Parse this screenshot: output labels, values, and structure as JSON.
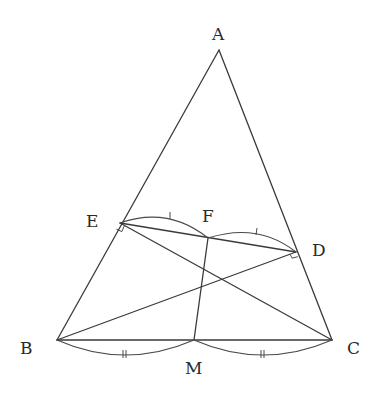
{
  "diagram": {
    "title": "",
    "points": {
      "A": {
        "label": "A",
        "x": 219,
        "y": 50
      },
      "B": {
        "label": "B",
        "x": 57,
        "y": 340
      },
      "C": {
        "label": "C",
        "x": 332,
        "y": 340
      },
      "D": {
        "label": "D",
        "x": 296,
        "y": 252
      },
      "E": {
        "label": "E",
        "x": 120,
        "y": 223
      },
      "F": {
        "label": "F",
        "x": 208,
        "y": 238
      },
      "M": {
        "label": "M",
        "x": 194,
        "y": 340
      }
    },
    "labels": {
      "A": "A",
      "B": "B",
      "C": "C",
      "D": "D",
      "E": "E",
      "F": "F",
      "M": "M"
    },
    "segments": [
      "AB",
      "AC",
      "BC",
      "BD",
      "CE",
      "ED",
      "FM"
    ],
    "right_angles": [
      "E (CE ⟂ AB)",
      "D (BD ⟂ AC)"
    ],
    "equal_marks": {
      "single_tick": [
        "EF",
        "FD"
      ],
      "double_tick": [
        "BM",
        "MC"
      ]
    },
    "colors": {
      "line": "#3a3a3a",
      "text": "#2a2a2a",
      "background": "#ffffff"
    }
  }
}
